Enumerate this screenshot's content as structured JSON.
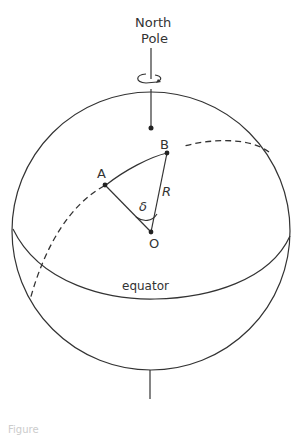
{
  "diagram": {
    "labels": {
      "north_pole_line1": "North",
      "north_pole_line2": "Pole",
      "point_a": "A",
      "point_b": "B",
      "point_o": "O",
      "radius": "R",
      "angle": "δ",
      "equator": "equator"
    },
    "caption": "Figure",
    "colors": {
      "stroke": "#333333",
      "background": "#ffffff"
    }
  }
}
